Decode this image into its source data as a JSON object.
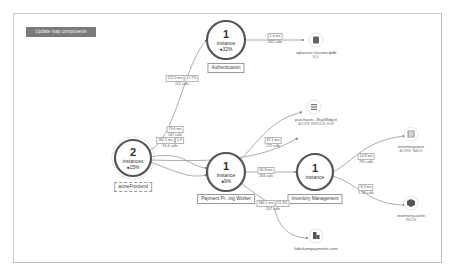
{
  "toolbar": {
    "update_label": "Update map components"
  },
  "nodes": {
    "frontend": {
      "count": "2",
      "instances": "instances",
      "pct": "●15%",
      "label": "acmeFrontend"
    },
    "auth": {
      "count": "1",
      "instances": "instance",
      "pct": "●32%",
      "label": "Authentication"
    },
    "payment": {
      "count": "1",
      "instances": "instance",
      "pct": "●9%",
      "label": "Payment Pr...ing Worker"
    },
    "inventory": {
      "count": "1",
      "instances": "instance",
      "label": "Inventory Management"
    }
  },
  "dependencies": {
    "sql": {
      "name": "sqlserver://acmesqldb",
      "type": "SQL"
    },
    "queue": {
      "name": "purchasin...BuyWidget",
      "type": "AZURE SERVICE HUB"
    },
    "table": {
      "name": "inventorystore",
      "type": "AZURE TABLE"
    },
    "redis": {
      "name": "inventorycache",
      "type": "REDIS"
    },
    "http": {
      "name": "fabrikampayments.com",
      "type": ""
    }
  },
  "edges": {
    "front_auth": {
      "duration": "122.9 ms",
      "failed": "17.7%",
      "calls": "112 calls"
    },
    "auth_sql": {
      "duration": "1.4 ms",
      "calls": "402 calls"
    },
    "front_payment_1": {
      "duration": "79.6 ms",
      "calls": "147 calls"
    },
    "front_payment_2": {
      "duration": "182.1 ms",
      "failed": "5.9",
      "calls": "91.6 calls"
    },
    "payment_queue": {
      "duration": "37.1 ms",
      "calls": "172 calls"
    },
    "payment_inventory": {
      "duration": "30.8 ms",
      "calls": "263 calls"
    },
    "payment_http": {
      "duration": "384.1 ms",
      "failed": "21.3%",
      "calls": "207 calls"
    },
    "inventory_table": {
      "duration": "14.8 ms",
      "calls": "791 calls"
    },
    "inventory_redis": {
      "duration": "8.3 ms",
      "calls": "1.1K calls"
    }
  },
  "colors": {
    "ring": "#555555",
    "ring_light": "#c8c8c8",
    "edge": "#8a8a8a",
    "button": "#7a7a7a"
  }
}
